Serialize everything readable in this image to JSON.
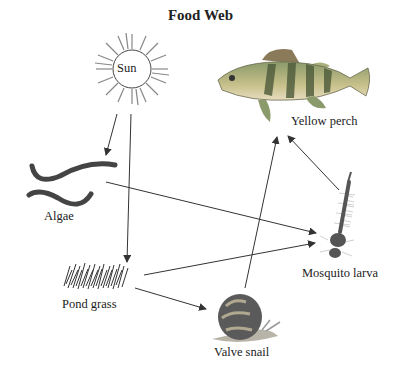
{
  "title": "Food Web",
  "organisms": {
    "sun": {
      "label": "Sun",
      "icon": "sun-icon"
    },
    "yellow_perch": {
      "label": "Yellow perch",
      "icon": "fish-icon"
    },
    "algae": {
      "label": "Algae",
      "icon": "algae-icon"
    },
    "mosquito_larva": {
      "label": "Mosquito larva",
      "icon": "larva-icon"
    },
    "pond_grass": {
      "label": "Pond grass",
      "icon": "grass-icon"
    },
    "valve_snail": {
      "label": "Valve snail",
      "icon": "snail-icon"
    }
  },
  "arrows": [
    {
      "from": "Sun",
      "to": "Algae"
    },
    {
      "from": "Sun",
      "to": "Pond grass"
    },
    {
      "from": "Algae",
      "to": "Mosquito larva"
    },
    {
      "from": "Pond grass",
      "to": "Mosquito larva"
    },
    {
      "from": "Pond grass",
      "to": "Valve snail"
    },
    {
      "from": "Valve snail",
      "to": "Yellow perch"
    },
    {
      "from": "Mosquito larva",
      "to": "Yellow perch"
    }
  ]
}
